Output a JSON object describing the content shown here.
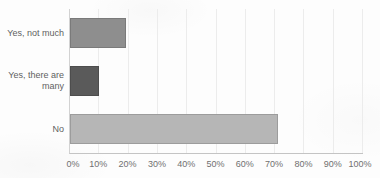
{
  "chart_data": {
    "type": "bar",
    "orientation": "horizontal",
    "title": "",
    "categories": [
      "Yes, not much",
      "Yes, there are many",
      "No"
    ],
    "values": [
      19,
      10,
      71
    ],
    "value_unit": "%",
    "xlim": [
      0,
      100
    ],
    "x_tick_step": 10,
    "x_tick_labels": [
      "0%",
      "10%",
      "20%",
      "30%",
      "40%",
      "50%",
      "60%",
      "70%",
      "80%",
      "90%",
      "100%"
    ],
    "grid": "vertical",
    "legend": "none",
    "bar_colors": [
      "#8e8e8e",
      "#5a5a5a",
      "#b6b6b6"
    ]
  },
  "colors": {
    "background": "#fdfdfd",
    "axis_line": "#c4c4c4",
    "grid_line": "#ececec",
    "category_text": "#5f5f5f",
    "tick_text": "#707070"
  }
}
